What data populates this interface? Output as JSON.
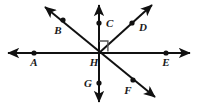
{
  "figure": {
    "canvas": {
      "width": 199,
      "height": 109
    },
    "colors": {
      "background": "#ffffff",
      "stroke": "#111111",
      "label": "#1a1a1a",
      "right_angle_marker": "#555555"
    },
    "labels": {
      "A": "A",
      "B": "B",
      "C": "C",
      "D": "D",
      "E": "E",
      "F": "F",
      "G": "G",
      "H": "H"
    },
    "points": [
      {
        "name": "A",
        "x": 34,
        "y": 53,
        "label_x": 34,
        "label_y": 66,
        "on": "horizontal-line"
      },
      {
        "name": "B",
        "x": 63,
        "y": 20,
        "label_x": 58,
        "label_y": 34,
        "on": "bf-diagonal"
      },
      {
        "name": "C",
        "x": 99,
        "y": 23,
        "label_x": 108,
        "label_y": 27,
        "on": "vertical-line"
      },
      {
        "name": "D",
        "x": 132,
        "y": 23,
        "label_x": 141,
        "label_y": 30,
        "on": "d-ray"
      },
      {
        "name": "E",
        "x": 166,
        "y": 53,
        "label_x": 166,
        "label_y": 66,
        "on": "horizontal-line"
      },
      {
        "name": "F",
        "x": 133,
        "y": 80,
        "label_x": 128,
        "label_y": 94,
        "on": "bf-diagonal"
      },
      {
        "name": "G",
        "x": 99,
        "y": 83,
        "label_x": 89,
        "label_y": 87,
        "on": "vertical-line"
      },
      {
        "name": "H",
        "x": 99,
        "y": 53,
        "label_x": 93,
        "label_y": 65,
        "on": "intersection"
      }
    ],
    "lines": [
      {
        "name": "horizontal-line",
        "description": "Double-headed horizontal line through A, H and E",
        "x1": 8,
        "y1": 53,
        "x2": 190,
        "y2": 53,
        "arrow_start": true,
        "arrow_end": true
      },
      {
        "name": "vertical-line",
        "description": "Double-headed vertical line through C, H and G",
        "x1": 99,
        "y1": 5,
        "x2": 99,
        "y2": 102,
        "arrow_start": true,
        "arrow_end": true
      },
      {
        "name": "bf-diagonal",
        "description": "Double-headed diagonal line through B, H and F",
        "x1": 45,
        "y1": 7,
        "x2": 155,
        "y2": 97,
        "arrow_start": true,
        "arrow_end": true
      },
      {
        "name": "d-ray",
        "description": "Ray from H up to the right through D",
        "x1": 99,
        "y1": 53,
        "x2": 152,
        "y2": 5,
        "arrow_start": false,
        "arrow_end": true
      }
    ],
    "markers": [
      {
        "name": "right-angle-marker",
        "description": "Right angle square between ray HC and ray HD",
        "vertex_x": 99,
        "vertex_y": 53,
        "size": 11
      }
    ]
  }
}
